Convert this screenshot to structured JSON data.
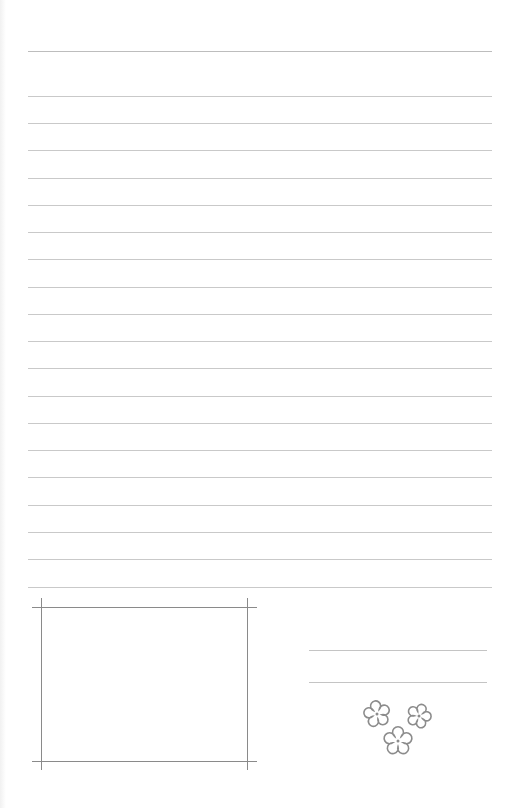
{
  "page": {
    "type": "lined-letter-paper",
    "background": "#ffffff"
  },
  "ruled_lines": {
    "color": "#c9c9c9",
    "left": 28,
    "right": 492,
    "top_rule_y": 51,
    "y_positions": [
      96,
      123,
      150,
      178,
      205,
      232,
      259,
      287,
      314,
      341,
      368,
      396,
      423,
      450,
      477,
      505,
      532,
      559,
      587
    ]
  },
  "photo_frame": {
    "color": "#8a8a8a",
    "top_y": 607,
    "bottom_y": 761,
    "left_x": 41,
    "right_x": 247,
    "h_extent": [
      32,
      257
    ],
    "v_extent": [
      598,
      770
    ]
  },
  "signature_lines": {
    "color": "#c4c4c4",
    "x": [
      309,
      487
    ],
    "y_positions": [
      650,
      682
    ]
  },
  "decoration": {
    "icon": "flower-icon",
    "stroke": "#8c8c8c",
    "flowers": [
      {
        "cx": 377,
        "cy": 714,
        "r": 12
      },
      {
        "cx": 419,
        "cy": 716,
        "r": 11
      },
      {
        "cx": 398,
        "cy": 741,
        "r": 13
      }
    ]
  }
}
